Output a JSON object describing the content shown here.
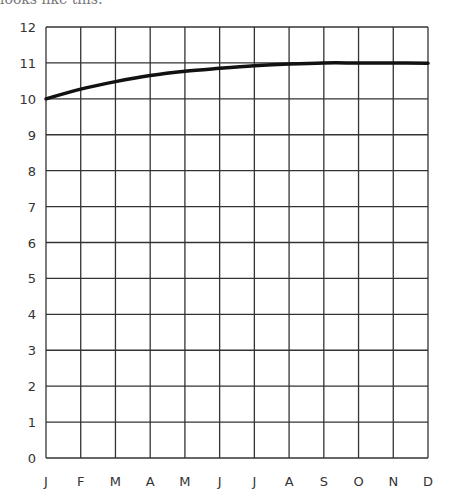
{
  "caption": "looks like this:",
  "chart_data": {
    "type": "line",
    "title": "",
    "xlabel": "",
    "ylabel": "",
    "categories": [
      "J",
      "F",
      "M",
      "A",
      "M",
      "J",
      "J",
      "A",
      "S",
      "O",
      "N",
      "D"
    ],
    "series": [
      {
        "name": "curve",
        "values": [
          10.0,
          10.27,
          10.48,
          10.65,
          10.77,
          10.85,
          10.92,
          10.97,
          11.0,
          11.0,
          11.0,
          10.99
        ]
      }
    ],
    "yticks": [
      "0",
      "1",
      "2",
      "3",
      "4",
      "5",
      "6",
      "7",
      "8",
      "9",
      "10",
      "11",
      "12"
    ],
    "ylim": [
      0,
      12
    ],
    "grid": true,
    "legend": "none",
    "line_color": "#111111"
  }
}
